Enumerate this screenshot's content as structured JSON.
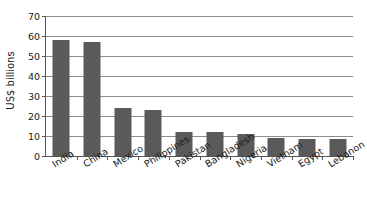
{
  "chart_data": {
    "type": "bar",
    "title": "",
    "subtitle": "",
    "xlabel": "",
    "ylabel": "US$ billions",
    "ylim": [
      0,
      70
    ],
    "ytick_step": 10,
    "yticks": [
      0,
      10,
      20,
      30,
      40,
      50,
      60,
      70
    ],
    "ytick_labels": [
      "0",
      "10",
      "20",
      "30",
      "40",
      "50",
      "60",
      "70"
    ],
    "grid": true,
    "grid_axis": "y",
    "legend": false,
    "legend_position": "none",
    "categories": [
      "India",
      "China",
      "Mexico",
      "Philippines",
      "Pakistan",
      "Bangladesh",
      "Nigeria",
      "Vietnam",
      "Egypt",
      "Lebanon"
    ],
    "values": [
      58,
      57,
      24,
      23,
      12,
      12,
      11,
      9,
      8.5,
      8.5
    ],
    "bar_color": "#5a5a5a",
    "axis_color": "#555555",
    "gridline_color": "#8c8c8c",
    "background_color": "#ffffff",
    "xtick_label_rotation": -32
  }
}
